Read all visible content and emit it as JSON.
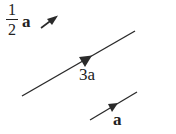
{
  "diagram": {
    "type": "vector-scaling",
    "stroke_color": "#2a2a2a",
    "labels": {
      "half_numerator": "1",
      "half_denominator": "2",
      "half_vector": "a",
      "triple": "3a",
      "unit": "a"
    },
    "vectors": [
      {
        "name": "half-a",
        "label": "½a",
        "from": [
          41,
          28
        ],
        "to": [
          57,
          16
        ],
        "arrow": "tip"
      },
      {
        "name": "three-a",
        "label": "3a",
        "from": [
          22,
          96
        ],
        "to": [
          135,
          31
        ],
        "arrow": "mid"
      },
      {
        "name": "a",
        "label": "a",
        "from": [
          90,
          120
        ],
        "to": [
          137,
          92
        ],
        "arrow": "mid"
      }
    ]
  }
}
